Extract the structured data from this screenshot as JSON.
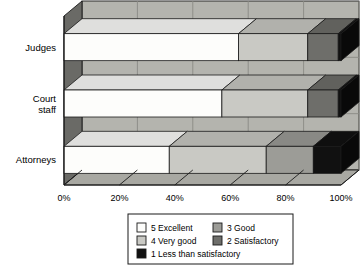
{
  "chart_data": {
    "type": "bar",
    "orientation": "horizontal",
    "stacked": true,
    "percent_stacked": true,
    "style": "3d",
    "title": "",
    "subtitle": "",
    "xlabel": "",
    "ylabel": "",
    "categories": [
      "Judges",
      "Court staff",
      "Attorneys"
    ],
    "category_label_lines": [
      [
        "Judges"
      ],
      [
        "Court",
        "staff"
      ],
      [
        "Attorneys"
      ]
    ],
    "xlim": [
      0,
      100
    ],
    "xticks": [
      0,
      20,
      40,
      60,
      80,
      100
    ],
    "xtick_labels": [
      "0%",
      "20%",
      "40%",
      "60%",
      "80%",
      "100%"
    ],
    "grid": true,
    "legend_position": "bottom",
    "series": [
      {
        "name": "5 Excellent",
        "color": "#fdfdfb",
        "values": [
          63,
          57,
          38
        ]
      },
      {
        "name": "4 Very good",
        "color": "#c9c9c4",
        "values": [
          25,
          31,
          35
        ]
      },
      {
        "name": "3 Good",
        "color": "#9c9c97",
        "values": [
          0,
          0,
          17
        ]
      },
      {
        "name": "2 Satisfactory",
        "color": "#6e6e6a",
        "values": [
          11,
          11,
          0
        ]
      },
      {
        "name": "1 Less than satisfactory",
        "color": "#111111",
        "values": [
          1,
          1,
          10
        ]
      }
    ]
  },
  "legend": {
    "entries": [
      {
        "label": "5 Excellent",
        "color": "#fdfdfb"
      },
      {
        "label": "3 Good",
        "color": "#9c9c97"
      },
      {
        "label": "4 Very good",
        "color": "#c9c9c4"
      },
      {
        "label": "2 Satisfactory",
        "color": "#6e6e6a"
      },
      {
        "label": "1 Less than satisfactory",
        "color": "#111111"
      }
    ]
  },
  "colors": {
    "plot_background": "#b4b4ae",
    "side_wall": "#6a6a66",
    "floor": "#a8a8a2",
    "grid_line": "#8a8a85",
    "outline": "#1a1a1a",
    "page_background": "#ffffff",
    "legend_border": "#1a1a1a"
  }
}
